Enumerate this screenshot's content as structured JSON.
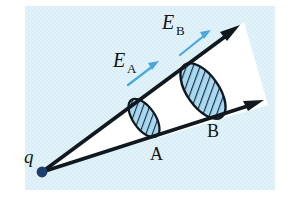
{
  "figure": {
    "type": "physics-diagram",
    "background_color": "#d9eef7",
    "canvas": {
      "width": 291,
      "height": 204
    },
    "plate_rect": {
      "x": 25,
      "y": 6,
      "width": 250,
      "height": 184
    }
  },
  "colors": {
    "background": "#d9eef7",
    "cone_fill": "#ffffff",
    "ray_stroke": "#101820",
    "ellipse_fill": "#a9d9ef",
    "ellipse_hatch": "#1b2a45",
    "ellipse_stroke": "#101820",
    "field_arrow": "#4aa8dd",
    "charge_dot": "#1d3f6e",
    "label_text": "#141414"
  },
  "charge": {
    "label": "q",
    "dot_center": {
      "x": 42,
      "y": 172
    },
    "dot_radius": 5,
    "label_position": {
      "x": 24,
      "y": 160
    }
  },
  "rays": [
    {
      "name": "upper-ray",
      "from": {
        "x": 42,
        "y": 172
      },
      "to": {
        "x": 238,
        "y": 27
      },
      "stroke_width": 3.6,
      "arrowhead": true
    },
    {
      "name": "lower-ray",
      "from": {
        "x": 42,
        "y": 172
      },
      "to": {
        "x": 262,
        "y": 101
      },
      "stroke_width": 3.6,
      "arrowhead": true
    }
  ],
  "cross_sections": [
    {
      "id": "A",
      "label": "A",
      "label_position": {
        "x": 155,
        "y": 158
      },
      "center": {
        "x": 144,
        "y": 118
      },
      "rx": 11,
      "ry": 22,
      "rotation_deg": -35,
      "hatched": true
    },
    {
      "id": "B",
      "label": "B",
      "label_position": {
        "x": 212,
        "y": 135
      },
      "center": {
        "x": 203,
        "y": 91
      },
      "rx": 16,
      "ry": 32,
      "rotation_deg": -35,
      "hatched": true
    }
  ],
  "field_labels": [
    {
      "id": "E_A",
      "symbol": "E",
      "subscript": "A",
      "position": {
        "x": 116,
        "y": 62
      },
      "arrow": {
        "from": {
          "x": 128,
          "y": 85
        },
        "to": {
          "x": 159,
          "y": 61
        }
      }
    },
    {
      "id": "E_B",
      "symbol": "E",
      "subscript": "B",
      "position": {
        "x": 165,
        "y": 24
      },
      "arrow": {
        "from": {
          "x": 180,
          "y": 55
        },
        "to": {
          "x": 211,
          "y": 30
        }
      }
    }
  ]
}
